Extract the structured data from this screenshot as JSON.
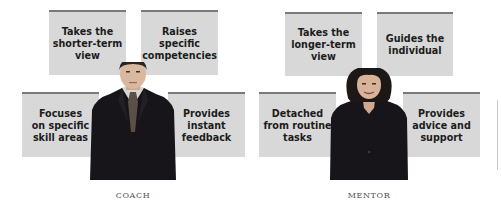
{
  "coach": {
    "label": "COACH",
    "boxes": [
      {
        "lines": [
          "Takes the",
          "shorter-term",
          "view"
        ]
      },
      {
        "lines": [
          "Raises specific",
          "competencies"
        ]
      },
      {
        "lines": [
          "Focuses",
          "on specific",
          "skill areas"
        ]
      },
      {
        "lines": [
          "Provides",
          "instant",
          "feedback"
        ]
      }
    ],
    "image": "man-in-suit-photo"
  },
  "mentor": {
    "label": "MENTOR",
    "boxes": [
      {
        "lines": [
          "Takes the",
          "longer-term",
          "view"
        ]
      },
      {
        "lines": [
          "Guides the",
          "individual"
        ]
      },
      {
        "lines": [
          "Detached",
          "from routine",
          "tasks"
        ]
      },
      {
        "lines": [
          "Provides",
          "advice and",
          "support"
        ]
      }
    ],
    "image": "woman-in-suit-photo"
  },
  "colors": {
    "box_fill": "#d8d8d8",
    "box_top_border": "#7a7a7a",
    "text": "#1c1c1c",
    "suit": "#151318"
  }
}
